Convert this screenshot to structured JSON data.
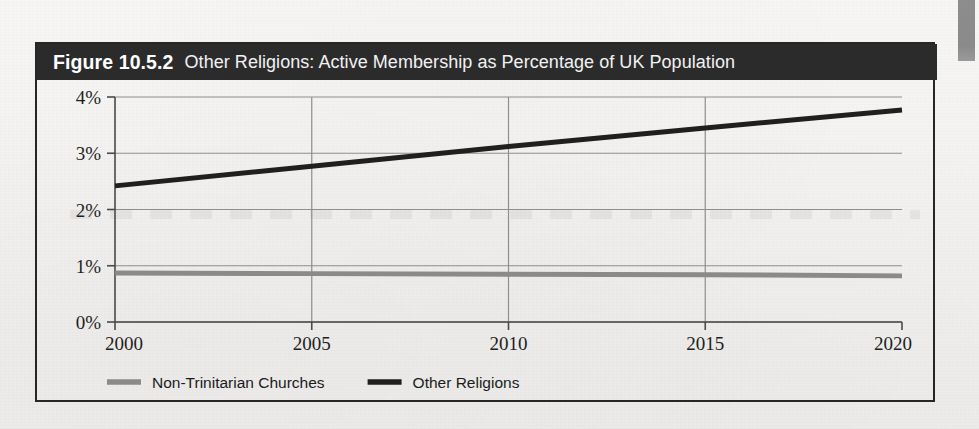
{
  "figure": {
    "number_label": "Figure 10.5.2",
    "title": "Other Religions: Active Membership as Percentage of UK Population"
  },
  "chart_data": {
    "type": "line",
    "title": "Other Religions: Active Membership as Percentage of UK Population",
    "xlabel": "",
    "ylabel": "",
    "x": [
      2000,
      2005,
      2010,
      2015,
      2020
    ],
    "categories": [
      "2000",
      "2005",
      "2010",
      "2015",
      "2020"
    ],
    "xtick_labels": [
      "2000",
      "2005",
      "2010",
      "2015",
      "2020"
    ],
    "ytick_labels": [
      "0%",
      "1%",
      "2%",
      "3%",
      "4%"
    ],
    "ytick_values": [
      0,
      1,
      2,
      3,
      4
    ],
    "xlim": [
      2000,
      2020
    ],
    "ylim": [
      0,
      4
    ],
    "grid": true,
    "legend_position": "bottom",
    "series": [
      {
        "name": "Non-Trinitarian Churches",
        "color": "#8a8a8a",
        "values": [
          0.87,
          0.86,
          0.85,
          0.84,
          0.82
        ]
      },
      {
        "name": "Other Religions",
        "color": "#1f1f1f",
        "values": [
          2.42,
          2.77,
          3.12,
          3.45,
          3.77
        ]
      }
    ]
  },
  "legend": {
    "entries": [
      {
        "label": "Non-Trinitarian Churches",
        "color": "#8a8a8a"
      },
      {
        "label": "Other Religions",
        "color": "#1f1f1f"
      }
    ]
  },
  "colors": {
    "title_band_bg": "#2b2b2b",
    "title_text": "#ffffff",
    "frame_border": "#262626",
    "grid": "#8e8e8e",
    "axis": "#4a4a4a",
    "page_bg": "#f3f2f0",
    "series_gray": "#8a8a8a",
    "series_black": "#1f1f1f",
    "edge_tab": "#8a8a8a"
  }
}
